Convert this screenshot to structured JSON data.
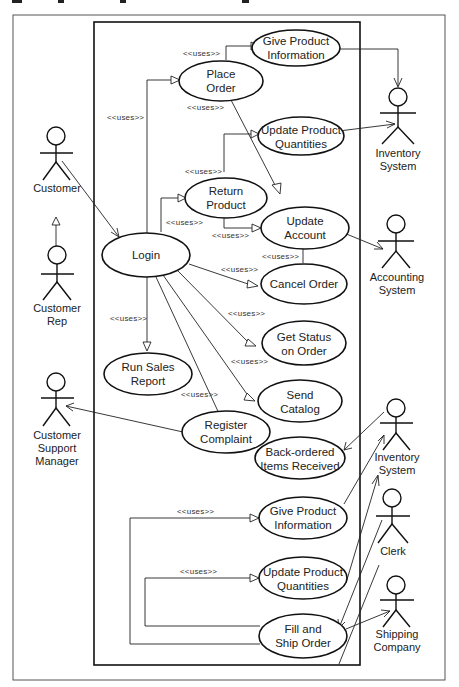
{
  "figure": {
    "title_visible_fragment": "",
    "stereotype": "<<uses>>"
  },
  "use_cases": {
    "give_product_info_top": [
      "Give Product",
      "Information"
    ],
    "place_order": [
      "Place",
      "Order"
    ],
    "update_product_qty_top": [
      "Update Product",
      "Quantities"
    ],
    "return_product": [
      "Return",
      "Product"
    ],
    "update_account": [
      "Update",
      "Account"
    ],
    "login": [
      "Login"
    ],
    "cancel_order": [
      "Cancel Order"
    ],
    "get_status": [
      "Get Status",
      "on Order"
    ],
    "run_sales_report": [
      "Run Sales",
      "Report"
    ],
    "send_catalog": [
      "Send",
      "Catalog"
    ],
    "register_complaint": [
      "Register",
      "Complaint"
    ],
    "back_ordered": [
      "Back-ordered",
      "Items Received"
    ],
    "give_product_info_bottom": [
      "Give Product",
      "Information"
    ],
    "update_product_qty_bottom": [
      "Update Product",
      "Quantities"
    ],
    "fill_ship_order": [
      "Fill and",
      "Ship Order"
    ]
  },
  "actors": {
    "inventory_top": [
      "Inventory",
      "System"
    ],
    "customer": [
      "Customer"
    ],
    "accounting": [
      "Accounting",
      "System"
    ],
    "customer_rep": [
      "Customer",
      "Rep"
    ],
    "cs_manager": [
      "Customer",
      "Support",
      "Manager"
    ],
    "inventory_bottom": [
      "Inventory",
      "System"
    ],
    "clerk": [
      "Clerk"
    ],
    "shipping": [
      "Shipping",
      "Company"
    ]
  },
  "relations": {
    "uses_label": "<<uses>>"
  }
}
